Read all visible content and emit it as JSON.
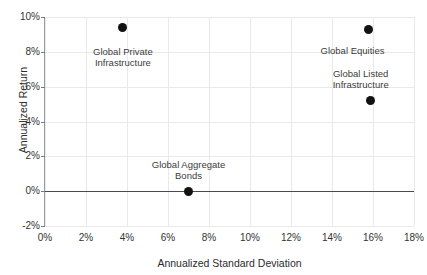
{
  "chart_data": {
    "type": "scatter",
    "title": "",
    "xlabel": "Annualized Standard Deviation",
    "ylabel": "Annualized Return",
    "xlim": [
      0,
      18
    ],
    "ylim": [
      -2,
      10
    ],
    "xticks": [
      "0%",
      "2%",
      "4%",
      "6%",
      "8%",
      "10%",
      "12%",
      "14%",
      "16%",
      "18%"
    ],
    "xtick_values": [
      0,
      2,
      4,
      6,
      8,
      10,
      12,
      14,
      16,
      18
    ],
    "yticks": [
      "-2%",
      "0%",
      "2%",
      "4%",
      "6%",
      "8%",
      "10%"
    ],
    "ytick_values": [
      -2,
      0,
      2,
      4,
      6,
      8,
      10
    ],
    "grid": true,
    "legend": "none",
    "zero_line": 0,
    "points": [
      {
        "label": "Global Private\nInfrastructure",
        "x": 3.8,
        "y": 9.4,
        "label_x": 3.8,
        "label_y": 8.35,
        "color": "#121212"
      },
      {
        "label": "Global Equities",
        "x": 15.8,
        "y": 9.3,
        "label_x": 15.0,
        "label_y": 8.4,
        "color": "#121212"
      },
      {
        "label": "Global Listed\nInfrastructure",
        "x": 15.9,
        "y": 5.2,
        "label_x": 15.4,
        "label_y": 7.1,
        "color": "#121212"
      },
      {
        "label": "Global Aggregate\nBonds",
        "x": 7.0,
        "y": 0.0,
        "label_x": 7.0,
        "label_y": 1.85,
        "color": "#121212"
      }
    ]
  },
  "colors": {
    "marker": "#121212",
    "grid": "#e9e9ec",
    "axis": "#9a9a9e",
    "zero_line": "#4a4a4a",
    "text": "#333333"
  }
}
